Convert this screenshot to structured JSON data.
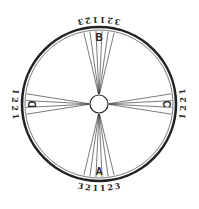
{
  "diagram": {
    "center": {
      "x": 99,
      "y": 104
    },
    "outer_radius": 77,
    "inner_ring_radius": 74,
    "hub_radius": 9,
    "colors": {
      "stroke": "#222222",
      "background": "#ffffff"
    },
    "sectors": [
      {
        "letter": "A",
        "position": "bottom",
        "angle": 90,
        "scale": [
          "3",
          "2",
          "1",
          "1",
          "2",
          "3"
        ]
      },
      {
        "letter": "B",
        "position": "top",
        "angle": 270,
        "scale": [
          "3",
          "2",
          "1",
          "1",
          "2",
          "3"
        ]
      },
      {
        "letter": "C",
        "position": "right",
        "angle": 0,
        "scale": [
          "1",
          "2",
          "2",
          "1"
        ]
      },
      {
        "letter": "D",
        "position": "left",
        "angle": 180,
        "scale": [
          "1",
          "2",
          "2",
          "1"
        ]
      }
    ]
  }
}
